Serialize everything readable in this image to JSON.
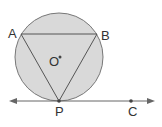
{
  "diagram": {
    "type": "geometry",
    "colors": {
      "circle_fill": "#d9d9d9",
      "stroke": "#555555",
      "background": "#ffffff"
    },
    "labels": {
      "A": "A",
      "B": "B",
      "O": "O",
      "P": "P",
      "C": "C"
    }
  }
}
